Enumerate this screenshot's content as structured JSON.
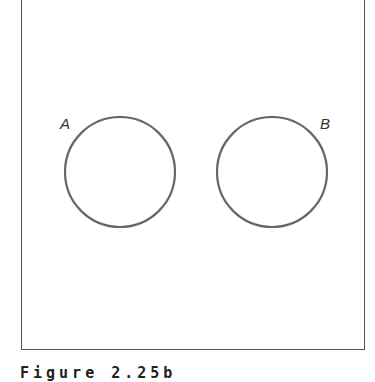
{
  "figure": {
    "caption": "Figure 2.25b",
    "sets": [
      {
        "label": "A",
        "cx": 120,
        "cy": 172,
        "r": 55
      },
      {
        "label": "B",
        "cx": 272,
        "cy": 172,
        "r": 55
      }
    ],
    "stroke_color": "#666666"
  }
}
